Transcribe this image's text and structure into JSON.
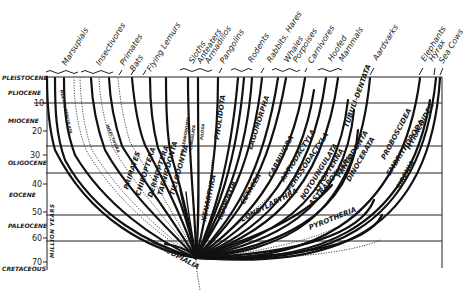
{
  "diagram": {
    "axis": {
      "label": "MILLION YEARS",
      "ticks": [
        "10",
        "20",
        "30",
        "40",
        "50",
        "60",
        "70"
      ],
      "epochs": [
        "PLEISTOCENE",
        "PLIOCENE",
        "MIOCENE",
        "OLIGOCENE",
        "EOCENE",
        "PALEOCENE",
        "CRETACEOUS"
      ]
    },
    "common_names": [
      "Marsupials",
      "Insectivores",
      "Primates",
      "Bats",
      "Flying Lemurs",
      "Sloths",
      "Anteaters",
      "Armadillos",
      "Pangolins",
      "Rodents",
      "Rabbits, Hares",
      "Whales",
      "Porpoises",
      "Carnivores",
      "Hoofed",
      "Mammals",
      "Aardvarks",
      "Elephants",
      "Hyrax",
      "Sea Cows"
    ],
    "orders": {
      "marsupialia": "MARSUPIALIA",
      "primates": "PRIMATES",
      "chiroptera": "CHIROPTERA",
      "dermoptera": "DERMOPTERA",
      "taeniodonta": "TAENIODONTA",
      "tillodontia": "TILLODONTIA",
      "xenarthra": "XENARTHRA",
      "pholidota": "PHOLIDOTA",
      "rodentia": "RODENTIA",
      "lagomorpha": "LAGOMORPHA",
      "cetacea": "CETACEA",
      "carnivora": "CARNIVORA",
      "artiodactyla": "ARTIODACTYLA",
      "perissodactyla": "PERISSODACTYLA",
      "condylarthra": "CONDYLARTHRA",
      "notoungulata": "NOTOUNGULATA",
      "litopterna": "LITOPTERNA",
      "astrapotheria": "ASTRAPOTHERIA",
      "tubulidentata": "TUBULI-DENTATA",
      "pantodonta": "PANTODONTA",
      "dinocerata": "DINOCERATA",
      "pyrotheria": "PYROTHERIA",
      "proboscidea": "PROBOSCIDEA",
      "embrithopoda": "EMBRITHOPODA",
      "hyracoidea": "HYRACOIDEA",
      "sirenia": "SIRENIA",
      "insectivora": "INSECTIVORA",
      "cingulata": "CINGULATA",
      "pilosa": "PILOSA",
      "palaeanodonta": "PALAEANODONTA",
      "multituberculata": "MULTITUBERCULATA"
    }
  }
}
